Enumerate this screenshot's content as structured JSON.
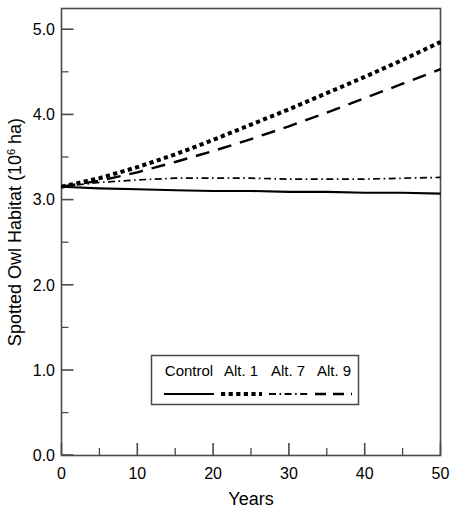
{
  "chart_data": {
    "type": "line",
    "title": "",
    "xlabel": "Years",
    "ylabel": "Spotted Owl Habitat (10^6 ha)",
    "ylabel_prefix": "Spotted Owl Habitat (10",
    "ylabel_exponent": "6",
    "ylabel_suffix": " ha)",
    "xlim": [
      0,
      50
    ],
    "ylim": [
      0.0,
      5.0
    ],
    "grid": false,
    "xticks": [
      0,
      10,
      20,
      30,
      40,
      50
    ],
    "xtick_labels": [
      "0",
      "10",
      "20",
      "30",
      "40",
      "50"
    ],
    "xminor_ticks": [
      5,
      15,
      25,
      35,
      45
    ],
    "yticks": [
      0.0,
      1.0,
      2.0,
      3.0,
      4.0,
      5.0
    ],
    "ytick_labels": [
      "0.0",
      "1.0",
      "2.0",
      "3.0",
      "4.0",
      "5.0"
    ],
    "yminor_ticks": [
      0.5,
      1.5,
      2.5,
      3.5,
      4.5
    ],
    "x": [
      0,
      5,
      10,
      15,
      20,
      25,
      30,
      35,
      40,
      45,
      50
    ],
    "series": [
      {
        "name": "Control",
        "style": "solid",
        "values": [
          3.15,
          3.13,
          3.12,
          3.11,
          3.1,
          3.1,
          3.09,
          3.09,
          3.08,
          3.08,
          3.07
        ]
      },
      {
        "name": "Alt. 1",
        "style": "dotted",
        "values": [
          3.15,
          3.25,
          3.38,
          3.53,
          3.7,
          3.88,
          4.06,
          4.25,
          4.44,
          4.64,
          4.85
        ]
      },
      {
        "name": "Alt. 7",
        "style": "dashdot",
        "values": [
          3.15,
          3.2,
          3.23,
          3.25,
          3.25,
          3.25,
          3.24,
          3.24,
          3.24,
          3.25,
          3.26
        ]
      },
      {
        "name": "Alt. 9",
        "style": "dashed",
        "values": [
          3.15,
          3.22,
          3.32,
          3.44,
          3.57,
          3.71,
          3.86,
          4.02,
          4.19,
          4.36,
          4.53
        ]
      }
    ],
    "legend": {
      "position": "inside-lower-center",
      "entries": [
        {
          "label": "Control",
          "style": "solid"
        },
        {
          "label": "Alt. 1",
          "style": "dotted"
        },
        {
          "label": "Alt. 7",
          "style": "dashdot"
        },
        {
          "label": "Alt. 9",
          "style": "dashed"
        }
      ]
    },
    "line_color": "#000000",
    "axis_color": "#4a4a4a"
  }
}
